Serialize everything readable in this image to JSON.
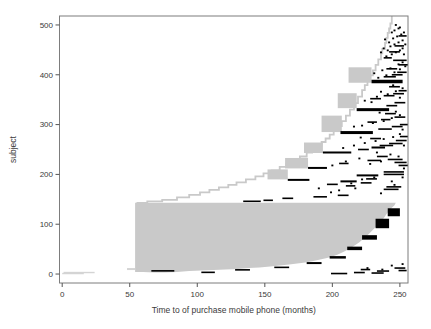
{
  "figure": {
    "background": "#ffffff"
  },
  "chart_data": {
    "type": "scatter",
    "variant": "event-history interval-censored segment plot (per-subject horizontal segments)",
    "title": "",
    "xlabel": "Time to of purchase mobile phone (months)",
    "ylabel": "subject",
    "xlim": [
      -2,
      256
    ],
    "ylim": [
      -18,
      518
    ],
    "x_ticks": [
      0,
      50,
      100,
      150,
      200,
      250
    ],
    "y_ticks": [
      0,
      100,
      200,
      300,
      400,
      500
    ],
    "grid": false,
    "legend": "none",
    "colors": {
      "censored_fill": "#c9c9c9",
      "light_fill": "#d4d4d4",
      "event_fill": "#000000",
      "box": "#7d7d7d",
      "tick": "#555555",
      "text": "#3a3a3a"
    },
    "gray_region": {
      "polygon": [
        [
          54,
          143
        ],
        [
          247,
          143
        ],
        [
          246,
          138
        ],
        [
          244,
          133
        ],
        [
          242,
          127
        ],
        [
          240,
          120
        ],
        [
          238,
          112
        ],
        [
          235,
          103
        ],
        [
          232,
          94
        ],
        [
          229,
          86
        ],
        [
          226,
          78
        ],
        [
          223,
          71
        ],
        [
          220,
          64
        ],
        [
          217,
          58
        ],
        [
          214,
          53
        ],
        [
          211,
          48
        ],
        [
          208,
          44
        ],
        [
          204,
          39
        ],
        [
          200,
          35
        ],
        [
          196,
          32
        ],
        [
          191,
          29
        ],
        [
          186,
          26
        ],
        [
          180,
          23
        ],
        [
          174,
          21
        ],
        [
          168,
          19
        ],
        [
          161,
          17
        ],
        [
          154,
          15
        ],
        [
          146,
          13
        ],
        [
          138,
          12
        ],
        [
          130,
          10
        ],
        [
          121,
          9
        ],
        [
          112,
          8
        ],
        [
          103,
          7
        ],
        [
          94,
          6
        ],
        [
          85,
          4
        ],
        [
          76,
          3
        ],
        [
          68,
          3
        ],
        [
          60,
          4
        ],
        [
          54,
          4
        ]
      ]
    },
    "gray_notch": [
      48,
      54,
      8,
      12
    ],
    "bottom_gray_segments": [
      [
        0,
        16,
        1
      ],
      [
        1,
        24,
        3
      ]
    ],
    "staircase": [
      [
        55,
        143
      ],
      [
        63,
        146
      ],
      [
        74,
        149
      ],
      [
        85,
        154
      ],
      [
        94,
        159
      ],
      [
        102,
        164
      ],
      [
        109,
        169
      ],
      [
        116,
        174
      ],
      [
        123,
        179
      ],
      [
        129,
        184
      ],
      [
        136,
        190
      ],
      [
        143,
        196
      ],
      [
        149,
        202
      ],
      [
        155,
        208
      ],
      [
        161,
        215
      ],
      [
        166,
        221
      ],
      [
        171,
        228
      ],
      [
        176,
        236
      ],
      [
        181,
        244
      ],
      [
        185,
        251
      ],
      [
        189,
        258
      ],
      [
        192,
        265
      ],
      [
        195,
        272
      ],
      [
        198,
        280
      ],
      [
        201,
        288
      ],
      [
        204,
        297
      ],
      [
        207,
        307
      ],
      [
        210,
        318
      ],
      [
        213,
        330
      ],
      [
        216,
        343
      ],
      [
        219,
        356
      ],
      [
        222,
        369
      ],
      [
        224,
        379
      ],
      [
        226,
        389
      ],
      [
        228,
        399
      ],
      [
        230,
        409
      ],
      [
        232,
        420
      ],
      [
        234,
        431
      ],
      [
        236,
        443
      ],
      [
        237,
        452
      ],
      [
        239,
        464
      ],
      [
        240,
        474
      ],
      [
        241,
        484
      ],
      [
        242,
        493
      ],
      [
        243,
        503
      ],
      [
        244,
        518
      ]
    ],
    "gray_blocks": [
      [
        152,
        167,
        190,
        210
      ],
      [
        165,
        182,
        212,
        233
      ],
      [
        179,
        193,
        243,
        264
      ],
      [
        192,
        207,
        285,
        318
      ],
      [
        204,
        218,
        333,
        363
      ],
      [
        212,
        229,
        384,
        415
      ]
    ],
    "black_bars": [
      [
        66,
        83,
        5,
        8
      ],
      [
        103,
        113,
        3,
        5
      ],
      [
        128,
        139,
        7,
        10
      ],
      [
        157,
        168,
        12,
        15
      ],
      [
        181,
        192,
        20,
        24
      ],
      [
        198,
        210,
        31,
        36
      ],
      [
        211,
        222,
        48,
        55
      ],
      [
        222,
        233,
        69,
        78
      ],
      [
        232,
        242,
        92,
        111
      ],
      [
        241,
        250,
        116,
        132
      ],
      [
        167,
        183,
        187,
        191
      ],
      [
        182,
        196,
        211,
        215
      ],
      [
        193,
        214,
        242,
        246
      ],
      [
        206,
        230,
        281,
        287
      ],
      [
        218,
        242,
        327,
        333
      ],
      [
        229,
        252,
        383,
        390
      ],
      [
        206,
        218,
        184,
        188
      ],
      [
        218,
        234,
        196,
        200
      ],
      [
        229,
        239,
        252,
        256
      ]
    ],
    "black_dashes": [
      [
        134,
        147,
        146
      ],
      [
        149,
        156,
        148
      ],
      [
        163,
        171,
        152
      ],
      [
        186,
        196,
        155
      ],
      [
        204,
        212,
        158
      ],
      [
        196,
        204,
        180
      ],
      [
        210,
        217,
        177
      ],
      [
        225,
        233,
        191
      ],
      [
        238,
        253,
        200
      ],
      [
        238,
        253,
        205
      ],
      [
        238,
        249,
        170
      ],
      [
        240,
        251,
        175
      ],
      [
        221,
        229,
        183
      ],
      [
        205,
        212,
        222
      ],
      [
        226,
        236,
        228
      ],
      [
        241,
        252,
        230
      ],
      [
        246,
        255,
        224
      ],
      [
        233,
        241,
        236
      ],
      [
        249,
        256,
        218
      ],
      [
        219,
        227,
        250
      ],
      [
        235,
        245,
        258
      ],
      [
        242,
        252,
        262
      ],
      [
        247,
        255,
        268
      ],
      [
        228,
        236,
        272
      ],
      [
        250,
        256,
        276
      ],
      [
        234,
        244,
        291
      ],
      [
        244,
        252,
        296
      ],
      [
        250,
        256,
        300
      ],
      [
        226,
        233,
        305
      ],
      [
        236,
        243,
        310
      ],
      [
        246,
        254,
        315
      ],
      [
        239,
        247,
        322
      ],
      [
        240,
        248,
        338
      ],
      [
        246,
        254,
        344
      ],
      [
        228,
        236,
        352
      ],
      [
        238,
        246,
        358
      ],
      [
        245,
        253,
        362
      ],
      [
        249,
        255,
        368
      ],
      [
        242,
        250,
        376
      ],
      [
        238,
        247,
        396
      ],
      [
        244,
        252,
        400
      ],
      [
        248,
        255,
        405
      ],
      [
        245,
        255,
        429
      ],
      [
        240,
        248,
        412
      ],
      [
        249,
        256,
        420
      ],
      [
        242,
        250,
        446
      ],
      [
        246,
        253,
        458
      ],
      [
        249,
        255,
        478
      ],
      [
        238,
        244,
        434
      ],
      [
        199,
        211,
        1
      ],
      [
        216,
        224,
        3
      ],
      [
        229,
        238,
        2
      ],
      [
        233,
        242,
        6
      ],
      [
        246,
        254,
        12
      ],
      [
        249,
        255,
        7
      ],
      [
        221,
        228,
        9
      ]
    ],
    "black_dots": [
      [
        190,
        172
      ],
      [
        205,
        168
      ],
      [
        214,
        182
      ],
      [
        222,
        190
      ],
      [
        231,
        194
      ],
      [
        244,
        186
      ],
      [
        252,
        194
      ],
      [
        199,
        164
      ],
      [
        246,
        179
      ],
      [
        217,
        172
      ],
      [
        236,
        162
      ],
      [
        200,
        218
      ],
      [
        210,
        226
      ],
      [
        220,
        232
      ],
      [
        228,
        221
      ],
      [
        236,
        226
      ],
      [
        243,
        240
      ],
      [
        249,
        236
      ],
      [
        233,
        244
      ],
      [
        253,
        212
      ],
      [
        216,
        258
      ],
      [
        224,
        263
      ],
      [
        232,
        267
      ],
      [
        238,
        271
      ],
      [
        245,
        275
      ],
      [
        250,
        281
      ],
      [
        208,
        253
      ],
      [
        221,
        274
      ],
      [
        253,
        258
      ],
      [
        222,
        298
      ],
      [
        230,
        303
      ],
      [
        238,
        307
      ],
      [
        244,
        313
      ],
      [
        250,
        319
      ],
      [
        235,
        324
      ],
      [
        247,
        326
      ],
      [
        216,
        296
      ],
      [
        252,
        290
      ],
      [
        224,
        348
      ],
      [
        233,
        356
      ],
      [
        241,
        361
      ],
      [
        247,
        367
      ],
      [
        252,
        373
      ],
      [
        236,
        366
      ],
      [
        245,
        379
      ],
      [
        229,
        345
      ],
      [
        250,
        354
      ],
      [
        234,
        394
      ],
      [
        240,
        399
      ],
      [
        246,
        405
      ],
      [
        250,
        411
      ],
      [
        254,
        417
      ],
      [
        237,
        409
      ],
      [
        243,
        413
      ],
      [
        249,
        421
      ],
      [
        252,
        425
      ],
      [
        231,
        403
      ],
      [
        240,
        437
      ],
      [
        244,
        441
      ],
      [
        247,
        445
      ],
      [
        250,
        449
      ],
      [
        252,
        453
      ],
      [
        243,
        457
      ],
      [
        246,
        461
      ],
      [
        249,
        465
      ],
      [
        252,
        469
      ],
      [
        245,
        473
      ],
      [
        248,
        477
      ],
      [
        251,
        481
      ],
      [
        253,
        485
      ],
      [
        246,
        489
      ],
      [
        249,
        493
      ],
      [
        242,
        465
      ],
      [
        238,
        453
      ],
      [
        241,
        449
      ],
      [
        254,
        461
      ],
      [
        253,
        441
      ],
      [
        250,
        495
      ],
      [
        236,
        445
      ],
      [
        239,
        471
      ],
      [
        244,
        485
      ],
      [
        247,
        500
      ],
      [
        244,
        17
      ],
      [
        252,
        20
      ],
      [
        226,
        12
      ],
      [
        237,
        9
      ]
    ]
  }
}
